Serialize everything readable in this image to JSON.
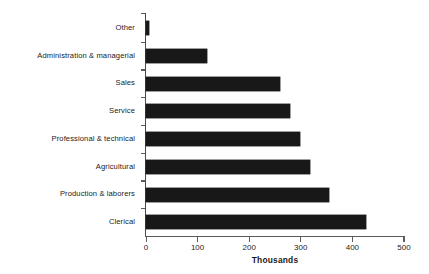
{
  "chart_data": {
    "type": "bar",
    "orientation": "horizontal",
    "title": "",
    "subtitle": "",
    "xlabel": "Thousands",
    "ylabel": "",
    "xlim": [
      0,
      500
    ],
    "xticks": [
      0,
      100,
      200,
      300,
      400,
      500
    ],
    "xtick_labels": [
      "0",
      "100",
      "200",
      "300",
      "400",
      "500"
    ],
    "grid": false,
    "legend": null,
    "bar_color": "#181818",
    "background_color": "#ffffff",
    "axis_color": "#5a5a5a",
    "categories": [
      "Other",
      "Administration & managerial",
      "Sales",
      "Service",
      "Professional & technical",
      "Agricultural",
      "Production & laborers",
      "Clerical"
    ],
    "values": [
      5,
      118,
      260,
      280,
      298,
      318,
      355,
      427
    ],
    "series": [
      {
        "name": "",
        "values": [
          5,
          118,
          260,
          280,
          298,
          318,
          355,
          427
        ]
      }
    ],
    "units": "thousands",
    "annotations": []
  }
}
